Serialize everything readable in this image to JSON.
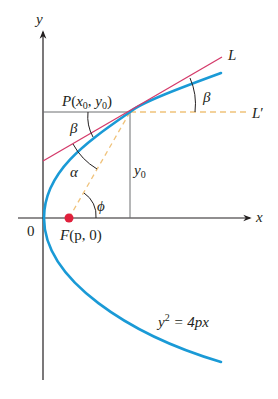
{
  "figure": {
    "axis_labels": {
      "x": "x",
      "y": "y",
      "origin": "0"
    },
    "point_P": {
      "name": "P",
      "x_sym": "x",
      "y_sym": "y",
      "sub": "0",
      "open": "(",
      "comma": ", ",
      "close": ")"
    },
    "focus": {
      "name": "F",
      "args": "(p, 0)"
    },
    "lines": {
      "tangent": "L",
      "horizontal": "L",
      "horizontal_prime": "′"
    },
    "y0_label": {
      "sym": "y",
      "sub": "0"
    },
    "angles": {
      "beta_top": "β",
      "beta_left": "β",
      "alpha": "α",
      "phi": "ϕ"
    },
    "equation": {
      "lhs": "y",
      "exp": "2",
      "rhs": " = 4px"
    },
    "colors": {
      "parabola": "#1a9ad6",
      "tangent": "#d43a6a",
      "focus_point": "#e0203c",
      "dashed": "#f0c27a",
      "axes": "#231f20",
      "guides": "#6d6e71"
    }
  }
}
